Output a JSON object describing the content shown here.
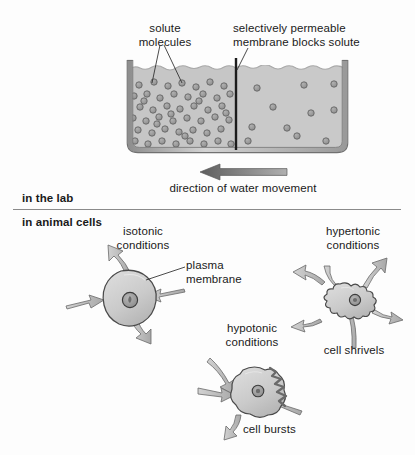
{
  "figure": {
    "title_hidden": "",
    "sections": [
      {
        "id": "in-the-lab",
        "label": "in the lab"
      },
      {
        "id": "in-animal-cells",
        "label": "in animal cells"
      }
    ]
  },
  "beaker": {
    "labels": {
      "solute": "solute\nmolecules",
      "membrane": "selectively permeable\nmembrane blocks solute"
    },
    "caption": "direction of water movement",
    "colors": {
      "fluid": "#c6c6c6",
      "fluid_right": "#c9c9c9",
      "glass": "#b4b4b4",
      "glass_edge": "#6f6f6f",
      "solute_fill": "#9a9a9a",
      "solute_edge": "#5d5d5d",
      "membrane": "#1c1c1c",
      "arrow": "#6e6e6e"
    },
    "solute_left_count": 52,
    "solute_right_count": 11
  },
  "cells": [
    {
      "id": "isotonic",
      "condition": "isotonic\nconditions",
      "outcome": "",
      "callout": "plasma\nmembrane",
      "arrows_in": 2,
      "arrows_out": 2
    },
    {
      "id": "hypertonic",
      "condition": "hypertonic\nconditions",
      "outcome": "cell shrivels",
      "callout": "",
      "arrows_in": 2,
      "arrows_out": 4
    },
    {
      "id": "hypotonic",
      "condition": "hypotonic\nconditions",
      "outcome": "cell bursts",
      "callout": "",
      "arrows_in": 3,
      "arrows_out": 1
    }
  ],
  "palette": {
    "cell_fill": "#cfcfcf",
    "cell_edge": "#4a4a4a",
    "nucleus_fill": "#9d9d9d",
    "nucleus_edge": "#3c3c3c",
    "arrow_fill": "#bdbdbd",
    "arrow_edge": "#6a6a6a",
    "rupture": "#6a6a6a",
    "text": "#1a1a1a",
    "rule": "#8a8a8a"
  }
}
